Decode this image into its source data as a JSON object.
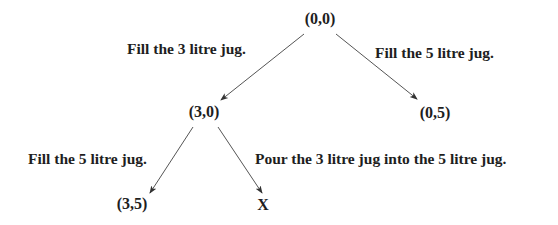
{
  "diagram": {
    "type": "state-space-tree",
    "colors": {
      "text": "#1e1e1e",
      "edge": "#555555",
      "background": "#ffffff"
    },
    "nodes": [
      {
        "id": "n00",
        "label": "(0,0)",
        "x": 320,
        "y": 11
      },
      {
        "id": "n30",
        "label": "(3,0)",
        "x": 204,
        "y": 104
      },
      {
        "id": "n05",
        "label": "(0,5)",
        "x": 435,
        "y": 105
      },
      {
        "id": "n35",
        "label": "(3,5)",
        "x": 132,
        "y": 196
      },
      {
        "id": "nX",
        "label": "X",
        "x": 263,
        "y": 197
      }
    ],
    "edges": [
      {
        "from": "n00",
        "to": "n30",
        "label": "Fill the 3 litre jug.",
        "x1": 304,
        "y1": 34,
        "x2": 221,
        "y2": 100,
        "label_x": 127,
        "label_y": 41
      },
      {
        "from": "n00",
        "to": "n05",
        "label": "Fill the 5 litre jug.",
        "x1": 336,
        "y1": 34,
        "x2": 417,
        "y2": 99,
        "label_x": 375,
        "label_y": 45
      },
      {
        "from": "n30",
        "to": "n35",
        "label": "Fill the 5 litre jug.",
        "x1": 193,
        "y1": 127,
        "x2": 150,
        "y2": 193,
        "label_x": 28,
        "label_y": 151
      },
      {
        "from": "n30",
        "to": "nX",
        "label": "Pour the 3 litre jug into the 5 litre jug.",
        "x1": 218,
        "y1": 127,
        "x2": 262,
        "y2": 193,
        "label_x": 255,
        "label_y": 151
      }
    ]
  }
}
